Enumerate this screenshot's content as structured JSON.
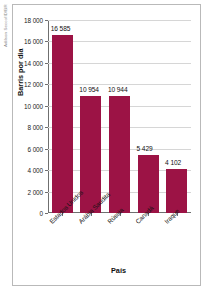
{
  "credit": "Adilson Secco/ID/BR",
  "chart_data": {
    "type": "bar",
    "title": "",
    "xlabel": "País",
    "ylabel": "Barris por dia",
    "categories": [
      "Estados Unidos",
      "Arábia Saudita",
      "Rússia",
      "Canadá",
      "Iraque"
    ],
    "values": [
      16585,
      10954,
      10944,
      5429,
      4102
    ],
    "value_labels": [
      "16 585",
      "10 954",
      "10 944",
      "5 429",
      "4 102"
    ],
    "ylim": [
      0,
      18000
    ],
    "ytick_values": [
      18000,
      16000,
      14000,
      12000,
      10000,
      8000,
      6000,
      4000,
      2000,
      0
    ],
    "ytick_labels": [
      "18 000",
      "16 000",
      "14 000",
      "12 000",
      "10 000",
      "8 000",
      "6 000",
      "4 000",
      "2 000",
      "0"
    ],
    "grid": true,
    "legend": false,
    "bar_color": "#9c1345",
    "grid_color": "#d6d6d6",
    "axis_color": "#6f6f6f"
  }
}
